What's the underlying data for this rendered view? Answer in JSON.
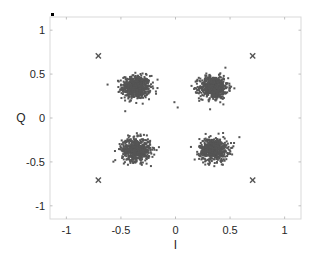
{
  "chart_data": {
    "type": "scatter",
    "title": "",
    "xlabel": "I",
    "ylabel": "Q",
    "xlim": [
      -1.15,
      1.15
    ],
    "ylim": [
      -1.15,
      1.15
    ],
    "xticks": [
      -1,
      -0.5,
      0,
      0.5,
      1
    ],
    "xtick_labels": [
      "-1",
      "-0.5",
      "0",
      "0.5",
      "1"
    ],
    "yticks": [
      -1,
      -0.5,
      0,
      0.5,
      1
    ],
    "ytick_labels": [
      "-1",
      "-0.5",
      "0",
      "0.5",
      "1"
    ],
    "grid": false,
    "legend": null,
    "series": [
      {
        "name": "received-symbols",
        "marker": "dot",
        "color": "#555555",
        "clusters": [
          {
            "center": [
              -0.36,
              0.35
            ],
            "std": 0.065,
            "count": 600
          },
          {
            "center": [
              0.35,
              0.35
            ],
            "std": 0.065,
            "count": 600
          },
          {
            "center": [
              -0.36,
              -0.36
            ],
            "std": 0.065,
            "count": 600
          },
          {
            "center": [
              0.35,
              -0.36
            ],
            "std": 0.065,
            "count": 600
          }
        ]
      },
      {
        "name": "reference-constellation",
        "marker": "x",
        "color": "#555555",
        "points": [
          [
            -0.707,
            0.707
          ],
          [
            0.707,
            0.707
          ],
          [
            -0.707,
            -0.707
          ],
          [
            0.707,
            -0.707
          ]
        ]
      }
    ]
  }
}
